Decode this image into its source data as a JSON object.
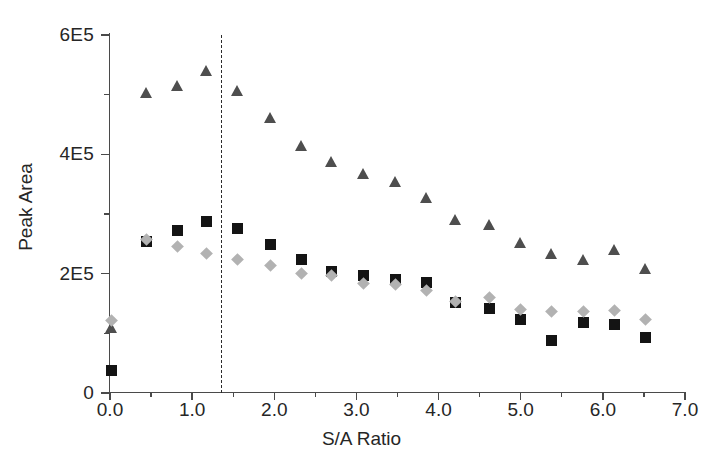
{
  "chart_data": {
    "type": "scatter",
    "title": "",
    "xlabel": "S/A Ratio",
    "ylabel": "Peak Area",
    "xlim": [
      0.0,
      7.0
    ],
    "ylim": [
      0,
      600000
    ],
    "grid": false,
    "legend": "none",
    "x_ticks": [
      "0.0",
      "1.0",
      "2.0",
      "3.0",
      "4.0",
      "5.0",
      "6.0",
      "7.0"
    ],
    "x_tick_values": [
      0.0,
      1.0,
      2.0,
      3.0,
      4.0,
      5.0,
      6.0,
      7.0
    ],
    "x_minor_tick_values": [
      0.5,
      1.5,
      2.5,
      3.5,
      4.5,
      5.5,
      6.5
    ],
    "y_ticks": [
      "0",
      "2E5",
      "4E5",
      "6E5"
    ],
    "y_tick_values": [
      0,
      200000,
      400000,
      600000
    ],
    "y_minor_tick_values": [
      100000,
      300000,
      500000
    ],
    "annotations": [
      {
        "name": "optimum-ratio-line",
        "type": "vertical-dashed-line",
        "x": 1.35,
        "label": ""
      }
    ],
    "series": [
      {
        "name": "Series A",
        "marker": "triangle",
        "color": "#4e4e4e",
        "points": [
          {
            "x": 0.02,
            "y": 110000
          },
          {
            "x": 0.45,
            "y": 503000
          },
          {
            "x": 0.82,
            "y": 515000
          },
          {
            "x": 1.17,
            "y": 540000
          },
          {
            "x": 1.55,
            "y": 507000
          },
          {
            "x": 1.95,
            "y": 461000
          },
          {
            "x": 2.33,
            "y": 415000
          },
          {
            "x": 2.7,
            "y": 388000
          },
          {
            "x": 3.08,
            "y": 368000
          },
          {
            "x": 3.47,
            "y": 355000
          },
          {
            "x": 3.85,
            "y": 327000
          },
          {
            "x": 4.21,
            "y": 290000
          },
          {
            "x": 4.62,
            "y": 283000
          },
          {
            "x": 5.0,
            "y": 253000
          },
          {
            "x": 5.38,
            "y": 233000
          },
          {
            "x": 5.76,
            "y": 223000
          },
          {
            "x": 6.14,
            "y": 240000
          },
          {
            "x": 6.52,
            "y": 208000
          }
        ]
      },
      {
        "name": "Series B",
        "marker": "square",
        "color": "#141414",
        "points": [
          {
            "x": 0.02,
            "y": 38000
          },
          {
            "x": 0.45,
            "y": 254000
          },
          {
            "x": 0.82,
            "y": 273000
          },
          {
            "x": 1.17,
            "y": 288000
          },
          {
            "x": 1.55,
            "y": 276000
          },
          {
            "x": 1.95,
            "y": 249000
          },
          {
            "x": 2.33,
            "y": 224000
          },
          {
            "x": 2.7,
            "y": 203000
          },
          {
            "x": 3.08,
            "y": 197000
          },
          {
            "x": 3.47,
            "y": 190000
          },
          {
            "x": 3.85,
            "y": 186000
          },
          {
            "x": 4.21,
            "y": 151000
          },
          {
            "x": 4.62,
            "y": 142000
          },
          {
            "x": 5.0,
            "y": 124000
          },
          {
            "x": 5.38,
            "y": 88000
          },
          {
            "x": 5.76,
            "y": 118000
          },
          {
            "x": 6.14,
            "y": 115000
          },
          {
            "x": 6.52,
            "y": 93000
          }
        ]
      },
      {
        "name": "Series C",
        "marker": "diamond",
        "color": "#b2b2b2",
        "points": [
          {
            "x": 0.02,
            "y": 122000
          },
          {
            "x": 0.45,
            "y": 258000
          },
          {
            "x": 0.82,
            "y": 246000
          },
          {
            "x": 1.17,
            "y": 234000
          },
          {
            "x": 1.55,
            "y": 223000
          },
          {
            "x": 1.95,
            "y": 214000
          },
          {
            "x": 2.33,
            "y": 200000
          },
          {
            "x": 2.7,
            "y": 197000
          },
          {
            "x": 3.08,
            "y": 184000
          },
          {
            "x": 3.47,
            "y": 182000
          },
          {
            "x": 3.85,
            "y": 171000
          },
          {
            "x": 4.21,
            "y": 153000
          },
          {
            "x": 4.62,
            "y": 160000
          },
          {
            "x": 5.0,
            "y": 140000
          },
          {
            "x": 5.38,
            "y": 137000
          },
          {
            "x": 5.76,
            "y": 136000
          },
          {
            "x": 6.14,
            "y": 139000
          },
          {
            "x": 6.52,
            "y": 124000
          }
        ]
      }
    ]
  }
}
